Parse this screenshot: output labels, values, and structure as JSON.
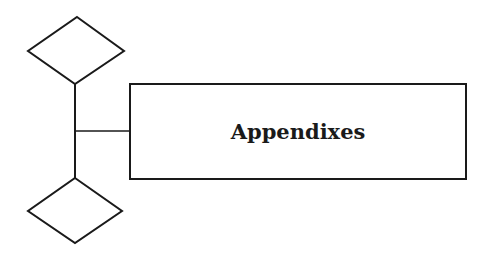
{
  "diagram": {
    "title_box": {
      "label": "Appendixes"
    },
    "stroke_color": "#1a1a1a",
    "background": "#ffffff",
    "shapes": [
      "diamond-top",
      "diamond-bottom",
      "connector-vertical",
      "connector-horizontal",
      "rectangle"
    ]
  }
}
